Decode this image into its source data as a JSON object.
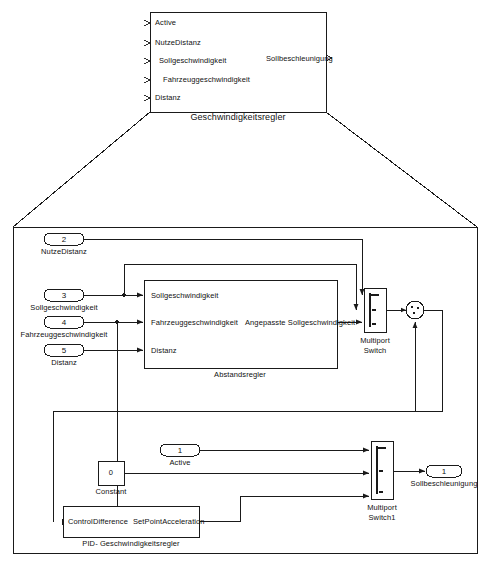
{
  "diagram": {
    "title": "Geschwindigkeitsregler",
    "type": "simulink-block-diagram",
    "line_color": "#1a1a1a",
    "fill_color": "#ffffff"
  },
  "top_block": {
    "name": "Geschwindigkeitsregler",
    "caption": "Geschwindigkeitsregler",
    "inputs": [
      {
        "label": "Active"
      },
      {
        "label": "NutzeDistanz"
      },
      {
        "label": "Sollgeschwindigkeit"
      },
      {
        "label": "Fahrzeuggeschwindigkeit"
      },
      {
        "label": "Distanz"
      }
    ],
    "outputs": [
      {
        "label": "Sollbeschleunigung"
      }
    ]
  },
  "subsystem": {
    "inports": [
      {
        "number": "2",
        "label": "NutzeDistanz"
      },
      {
        "number": "3",
        "label": "Sollgeschwindigkeit"
      },
      {
        "number": "4",
        "label": "Fahrzeuggeschwindigkeit"
      },
      {
        "number": "5",
        "label": "Distanz"
      },
      {
        "number": "1",
        "label": "Active"
      }
    ],
    "outports": [
      {
        "number": "1",
        "label": "Sollbeschleunigung"
      }
    ],
    "blocks": [
      {
        "name": "Abstandsregler",
        "caption": "Abstandsregler",
        "inputs": [
          {
            "label": "Sollgeschwindigkeit"
          },
          {
            "label": "Fahrzeuggeschwindigkeit"
          },
          {
            "label": "Distanz"
          }
        ],
        "outputs": [
          {
            "label": "Angepasste Sollgeschwindigkeit"
          }
        ]
      },
      {
        "name": "Multiport Switch",
        "caption_line1": "Multiport",
        "caption_line2": "Switch"
      },
      {
        "name": "Sum",
        "caption": ""
      },
      {
        "name": "Constant",
        "caption": "Constant",
        "value": "0"
      },
      {
        "name": "PID- Geschwindigkeitsregler",
        "caption": "PID-  Geschwindigkeitsregler",
        "inputs": [
          {
            "label": "ControlDifference"
          }
        ],
        "outputs": [
          {
            "label": "SetPointAcceleration"
          }
        ]
      },
      {
        "name": "Multiport Switch1",
        "caption_line1": "Multiport",
        "caption_line2": "Switch1"
      }
    ]
  }
}
